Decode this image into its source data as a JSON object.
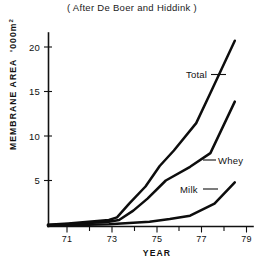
{
  "figure": {
    "title": "( After De Boer and Hiddink )",
    "background_color": "#ffffff",
    "line_color": "#0d0d0d"
  },
  "axes": {
    "y": {
      "title": "MEMBRANE AREA",
      "unit": "'000m",
      "unit_exponent": "2",
      "tick_labels": [
        "5",
        "10",
        "15",
        "20"
      ],
      "tick_values": [
        5,
        10,
        15,
        20
      ],
      "range_min": "0",
      "range_max": "22.5"
    },
    "x": {
      "title": "YEAR",
      "tick_labels": [
        "71",
        "73",
        "75",
        "77",
        "79"
      ],
      "tick_values": [
        71,
        73,
        75,
        77,
        79
      ],
      "minor_tick_values": [
        72,
        74,
        76,
        78
      ],
      "range_min": "70",
      "range_max": "79.8"
    }
  },
  "series_labels": {
    "total": "Total",
    "whey": "Whey",
    "milk": "Milk"
  },
  "chart_data": {
    "type": "line",
    "title": "( After De Boer and Hiddink )",
    "xlabel": "YEAR",
    "ylabel": "MEMBRANE AREA '000m2",
    "xlim": [
      70,
      79.8
    ],
    "ylim": [
      0,
      22.5
    ],
    "grid": false,
    "legend": "inline-labels-with-leader-lines",
    "yticks": [
      5,
      10,
      15,
      20
    ],
    "xticks": [
      71,
      73,
      75,
      77,
      79
    ],
    "series": [
      {
        "name": "Total",
        "label_position": "upper-right-inside",
        "x": [
          70.0,
          71.0,
          72.0,
          73.0,
          73.4,
          74.0,
          74.8,
          75.5,
          76.2,
          77.3,
          78.0,
          79.2
        ],
        "values": [
          0.15,
          0.3,
          0.5,
          0.7,
          1.0,
          2.6,
          4.6,
          7.0,
          8.8,
          12.0,
          15.5,
          21.6
        ]
      },
      {
        "name": "Whey",
        "label_position": "middle-right-inside",
        "x": [
          70.0,
          71.0,
          72.0,
          73.0,
          73.5,
          74.2,
          74.9,
          75.8,
          77.0,
          78.0,
          79.2
        ],
        "values": [
          0.1,
          0.2,
          0.35,
          0.5,
          0.7,
          1.8,
          3.2,
          5.3,
          6.9,
          8.5,
          14.5
        ]
      },
      {
        "name": "Milk",
        "label_position": "lower-right-inside",
        "x": [
          70.0,
          71.0,
          72.0,
          73.0,
          74.0,
          75.0,
          76.0,
          77.0,
          78.2,
          79.2
        ],
        "values": [
          0.05,
          0.1,
          0.15,
          0.2,
          0.35,
          0.5,
          0.8,
          1.2,
          2.6,
          5.1
        ]
      }
    ]
  }
}
